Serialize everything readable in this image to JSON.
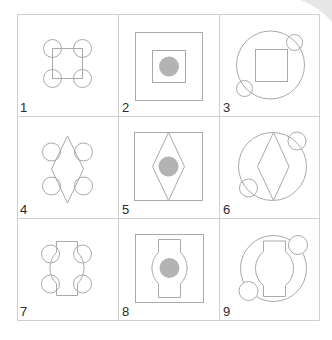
{
  "figure": {
    "colors": {
      "background": "#ffffff",
      "grid": "#cfcfcf",
      "stroke": "#a9a9a9",
      "dot_fill": "#b3b3b3",
      "label": "#2b2b2b"
    },
    "grid": {
      "rows": 3,
      "cols": 3,
      "x_lines": [
        17.5,
        118.5,
        219.5,
        319.5
      ],
      "y_lines": [
        14.5,
        116.5,
        218.5,
        320.5
      ]
    },
    "cells": [
      {
        "label": "1",
        "frame": "none",
        "core": "square",
        "fill_dot": false,
        "small_circles": "four-corners"
      },
      {
        "label": "2",
        "frame": "square",
        "core": "square",
        "fill_dot": true,
        "small_circles": "none"
      },
      {
        "label": "3",
        "frame": "circle",
        "core": "square",
        "fill_dot": false,
        "small_circles": "two-diagonal"
      },
      {
        "label": "4",
        "frame": "none",
        "core": "diamond",
        "fill_dot": false,
        "small_circles": "four-corners"
      },
      {
        "label": "5",
        "frame": "square",
        "core": "diamond",
        "fill_dot": true,
        "small_circles": "none"
      },
      {
        "label": "6",
        "frame": "circle",
        "core": "diamond",
        "fill_dot": false,
        "small_circles": "two-diagonal"
      },
      {
        "label": "7",
        "frame": "none",
        "core": "notched-circle",
        "fill_dot": false,
        "small_circles": "four-corners"
      },
      {
        "label": "8",
        "frame": "square",
        "core": "notched-circle",
        "fill_dot": true,
        "small_circles": "none"
      },
      {
        "label": "9",
        "frame": "circle",
        "core": "notched-circle",
        "fill_dot": false,
        "small_circles": "two-diagonal"
      }
    ]
  }
}
